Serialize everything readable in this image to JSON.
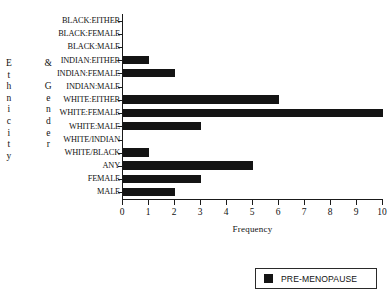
{
  "chart_data": {
    "type": "bar",
    "orientation": "horizontal",
    "title": "",
    "xlabel": "Frequency",
    "ylabel": "Ethnicity & Gender",
    "xlim": [
      0,
      10
    ],
    "xticks": [
      0,
      1,
      2,
      3,
      4,
      5,
      6,
      7,
      8,
      9,
      10
    ],
    "grid": false,
    "legend_position": "bottom-right",
    "categories": [
      "BLACK:EITHER",
      "BLACK:FEMALE",
      "BLACK:MALE",
      "INDIAN:EITHER",
      "INDIAN:FEMALE",
      "INDIAN:MALE",
      "WHITE:EITHER",
      "WHITE:FEMALE",
      "WHITE:MALE",
      "WHITE/INDIAN",
      "WHITE/BLACK",
      "ANY",
      "FEMALE",
      "MALE"
    ],
    "series": [
      {
        "name": "PRE-MENOPAUSE",
        "color": "#141414",
        "values": [
          0,
          0,
          0,
          1,
          2,
          0,
          6,
          10,
          3,
          0,
          1,
          5,
          3,
          2
        ]
      }
    ]
  },
  "y_axis_title": {
    "column_1": [
      "E",
      "t",
      "h",
      "n",
      "i",
      "c",
      "i",
      "t",
      "y"
    ],
    "column_2": [
      "&",
      "",
      "G",
      "e",
      "n",
      "d",
      "e",
      "r"
    ]
  },
  "legend": {
    "items": [
      {
        "label": "PRE-MENOPAUSE",
        "color": "#141414"
      }
    ]
  }
}
